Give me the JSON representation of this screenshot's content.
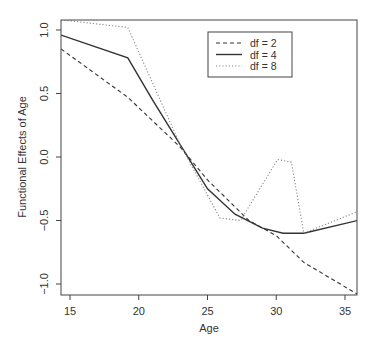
{
  "chart_data": {
    "type": "line",
    "title": "",
    "xlabel": "Age",
    "ylabel": "Functional Effects of Age",
    "xlim": [
      14.35,
      35.9
    ],
    "ylim": [
      -1.1,
      1.1
    ],
    "xticks": [
      15,
      20,
      25,
      30,
      35
    ],
    "yticks": [
      -1.0,
      -0.5,
      0.0,
      0.5,
      1.0
    ],
    "ytick_labels": [
      "-1.0",
      "-0.5",
      "0.0",
      "0.5",
      "1.0"
    ],
    "grid": false,
    "legend_position": "top-right-inside",
    "series": [
      {
        "name": "df = 2",
        "style": "dashed",
        "color": "#333333",
        "x": [
          14.35,
          19.2,
          23,
          25,
          28,
          30,
          32,
          35.9
        ],
        "y": [
          0.85,
          0.47,
          0.08,
          -0.18,
          -0.5,
          -0.62,
          -0.83,
          -1.08
        ]
      },
      {
        "name": "df = 4",
        "style": "solid",
        "color": "#333333",
        "x": [
          14.35,
          19.2,
          21,
          23,
          25,
          27,
          29,
          30.5,
          32,
          35.9
        ],
        "y": [
          0.96,
          0.78,
          0.45,
          0.1,
          -0.25,
          -0.45,
          -0.56,
          -0.6,
          -0.6,
          -0.5
        ]
      },
      {
        "name": "df = 8",
        "style": "dotted",
        "color": "#888888",
        "x": [
          14.35,
          19.2,
          23,
          25.9,
          27.4,
          30.1,
          31.1,
          32,
          35.9
        ],
        "y": [
          1.08,
          1.02,
          0.1,
          -0.48,
          -0.5,
          -0.02,
          -0.04,
          -0.6,
          -0.43
        ]
      }
    ]
  }
}
